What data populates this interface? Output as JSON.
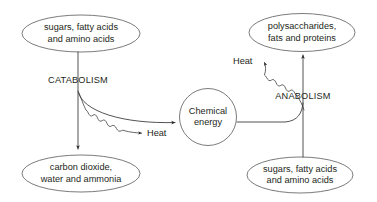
{
  "diagram": {
    "canvas": {
      "width": 377,
      "height": 202,
      "background": "#ffffff"
    },
    "colors": {
      "text": "#231f20",
      "shape_stroke": "#58595b",
      "connector_stroke": "#3f3f3f",
      "arrowhead": "#2b2b2b"
    },
    "nodes": {
      "catabolism_input": {
        "shape": "ellipse",
        "line1": "sugars, fatty acids",
        "line2": "and amino acids"
      },
      "catabolism_output": {
        "shape": "ellipse",
        "line1": "carbon dioxide,",
        "line2": "water and ammonia"
      },
      "chemical_energy": {
        "shape": "circle",
        "line1": "Chemical",
        "line2": "energy"
      },
      "anabolism_input": {
        "shape": "ellipse",
        "line1": "sugars, fatty acids",
        "line2": "and amino acids"
      },
      "anabolism_output": {
        "shape": "ellipse",
        "line1": "polysaccharides,",
        "line2": "fats and proteins"
      }
    },
    "process_labels": {
      "catabolism": "CATABOLISM",
      "anabolism": "ANABOLISM"
    },
    "energy_labels": {
      "catabolism_heat": "Heat",
      "anabolism_heat": "Heat"
    }
  }
}
